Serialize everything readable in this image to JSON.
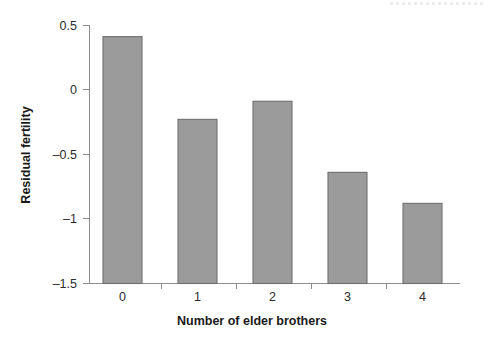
{
  "chart_data": {
    "type": "bar",
    "title": "",
    "subtitle": "",
    "xlabel": "Number of elder brothers",
    "ylabel": "Residual fertility",
    "categories": [
      "0",
      "1",
      "2",
      "3",
      "4"
    ],
    "values": [
      0.41,
      -0.23,
      -0.09,
      -0.64,
      -0.88
    ],
    "series": [
      {
        "name": "Residual fertility",
        "values": [
          0.41,
          -0.23,
          -0.09,
          -0.64,
          -0.88
        ]
      }
    ],
    "ylim": [
      -1.5,
      0.5
    ],
    "xlim": [
      -0.5,
      4.5
    ],
    "yticks": [
      0.5,
      0,
      -0.5,
      -1,
      -1.5
    ],
    "ytick_labels": [
      "0.5",
      "0",
      "–0.5",
      "–1",
      "–1.5"
    ],
    "xtick_labels": [
      "0",
      "1",
      "2",
      "3",
      "4"
    ],
    "grid": false,
    "legend": false,
    "legend_position": "none",
    "bar_color": "#9b9b9b",
    "bar_edge_color": "#6f6f6f",
    "axis_color": "#8c8c8c",
    "text_color": "#2b2b2b",
    "background_color": "#ffffff",
    "baseline_value": -1.5,
    "annotations": []
  },
  "figure": {
    "artifact_label": "scan-edge-artifact"
  }
}
